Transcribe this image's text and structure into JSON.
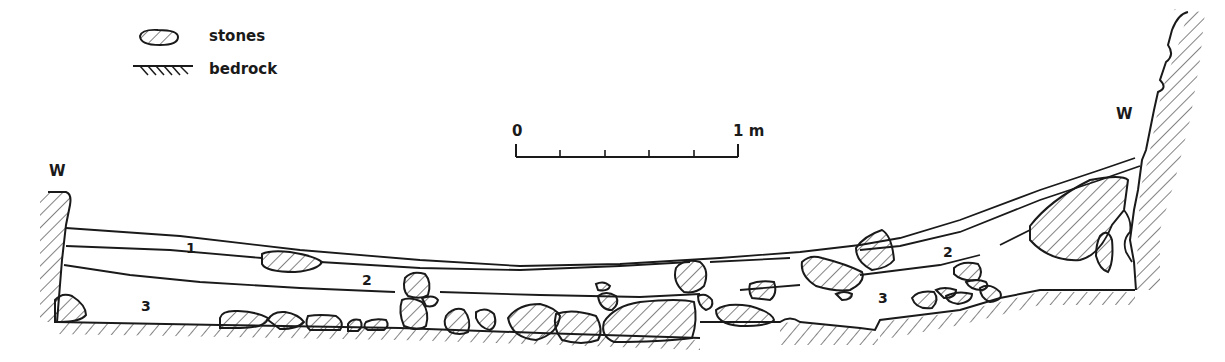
{
  "legend": {
    "items": [
      {
        "symbol": "stone-hatched-ellipse",
        "label": "stones"
      },
      {
        "symbol": "bedrock-hatch-line",
        "label": "bedrock"
      }
    ]
  },
  "scale_bar": {
    "start_label": "0",
    "end_label": "1 m",
    "subdivisions": 5
  },
  "walls": {
    "left_label": "W",
    "right_label": "W"
  },
  "layers": {
    "left": [
      {
        "label": "1"
      },
      {
        "label": "2"
      },
      {
        "label": "3"
      }
    ],
    "right": [
      {
        "label": "2"
      },
      {
        "label": "3"
      }
    ]
  },
  "colors": {
    "ink": "#1a1a1a",
    "background": "#ffffff"
  }
}
